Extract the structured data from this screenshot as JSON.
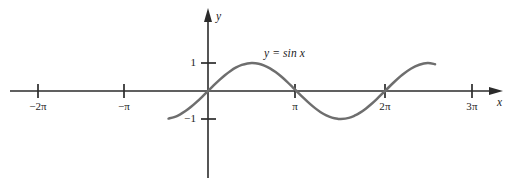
{
  "chart_data": {
    "type": "line",
    "title": "",
    "subtitle": "",
    "xlabel": "x",
    "ylabel": "y",
    "curve_label": "y = sin x",
    "curve_label_parts": {
      "y": "y",
      "equals": "=",
      "sin": "sin",
      "x": "x"
    },
    "function": "y = sin x",
    "xlim": [
      -7.2,
      9.9
    ],
    "ylim": [
      -2.9,
      2.9
    ],
    "grid": false,
    "legend": "none",
    "legend_position": "inline-annotation",
    "x_tick_labels": [
      "−2π",
      "−π",
      "π",
      "2π",
      "3π"
    ],
    "x_tick_values": [
      -6.283185,
      -3.141593,
      3.141593,
      6.283185,
      9.424778
    ],
    "y_tick_labels": [
      "1",
      "−1"
    ],
    "y_tick_values": [
      1,
      -1
    ],
    "x_domain_drawn": [
      -1.4,
      5.06
    ],
    "series": [
      {
        "name": "y = sin x",
        "color": "#6e6e6e",
        "x": [
          -1.4,
          -1.2,
          -1.0,
          -0.8,
          -0.6,
          -0.4,
          -0.2,
          0.0,
          0.2,
          0.4,
          0.6,
          0.8,
          1.0,
          1.2,
          1.4,
          1.5708,
          1.8,
          2.0,
          2.2,
          2.4,
          2.6,
          2.8,
          3.0,
          3.1416,
          3.4,
          3.6,
          3.8,
          4.0,
          4.2,
          4.4,
          4.6,
          4.7124,
          5.0,
          5.2,
          5.4,
          5.6,
          5.8,
          6.0,
          6.2832,
          6.6,
          6.9,
          7.2,
          7.5,
          7.8,
          8.06
        ],
        "y": [
          -0.9854,
          -0.932,
          -0.8415,
          -0.7174,
          -0.5646,
          -0.3894,
          -0.1987,
          0.0,
          0.1987,
          0.3894,
          0.5646,
          0.7174,
          0.8415,
          0.932,
          0.9854,
          1.0,
          0.9738,
          0.9093,
          0.8085,
          0.6755,
          0.5155,
          0.335,
          0.1411,
          0.0,
          -0.2555,
          -0.4425,
          -0.6119,
          -0.7568,
          -0.8716,
          -0.9516,
          -0.9937,
          -1.0,
          -0.9589,
          -0.8835,
          -0.7728,
          -0.6313,
          -0.4646,
          -0.2794,
          0.0,
          0.3115,
          0.5784,
          0.7937,
          0.938,
          0.999,
          0.9571
        ]
      }
    ],
    "axes": {
      "x_axis_arrow": true,
      "y_axis_arrow": true,
      "axis_color": "#2b2b2b",
      "curve_color": "#6e6e6e",
      "origin_label": ""
    },
    "annotations": [
      {
        "text": "y = sin x",
        "x": 1.05,
        "y": 1.55
      }
    ]
  }
}
